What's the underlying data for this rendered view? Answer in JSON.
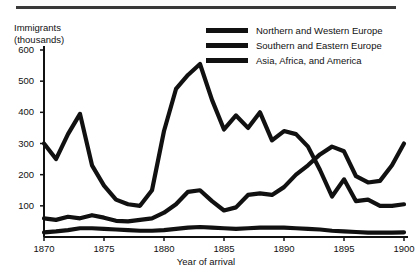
{
  "figure": {
    "top_rule": "decorative-rule",
    "y_axis_title": "Immigrants\n(thousands)",
    "x_axis_title": "Year of arrival"
  },
  "legend": {
    "position": "top-right",
    "entries": [
      {
        "label": "Northern and Western Europe",
        "color": "#111111",
        "thickness": 5
      },
      {
        "label": "Southern and Eastern Europe",
        "color": "#111111",
        "thickness": 5
      },
      {
        "label": "Asia, Africa, and America",
        "color": "#111111",
        "thickness": 5
      }
    ]
  },
  "chart_data": {
    "type": "line",
    "title": "",
    "xlabel": "Year of arrival",
    "ylabel": "Immigrants (thousands)",
    "xlim": [
      1870,
      1900
    ],
    "ylim": [
      0,
      600
    ],
    "xticks": [
      1870,
      1875,
      1880,
      1885,
      1890,
      1895,
      1900
    ],
    "yticks": [
      0,
      100,
      200,
      300,
      400,
      500,
      600
    ],
    "xticklabels": [
      "1870",
      "1875",
      "1880",
      "1885",
      "1890",
      "1895",
      "1900"
    ],
    "yticklabels": [
      "0",
      "100",
      "200",
      "300",
      "400",
      "500",
      "600"
    ],
    "grid": false,
    "legend_position": "top-right",
    "x": [
      1870,
      1871,
      1872,
      1873,
      1874,
      1875,
      1876,
      1877,
      1878,
      1879,
      1880,
      1881,
      1882,
      1883,
      1884,
      1885,
      1886,
      1887,
      1888,
      1889,
      1890,
      1891,
      1892,
      1893,
      1894,
      1895,
      1896,
      1897,
      1898,
      1899,
      1900
    ],
    "series": [
      {
        "name": "Northern and Western Europe",
        "color": "#111111",
        "values": [
          300,
          250,
          330,
          395,
          230,
          165,
          120,
          105,
          100,
          150,
          340,
          475,
          520,
          555,
          440,
          345,
          390,
          350,
          400,
          310,
          340,
          330,
          290,
          215,
          130,
          185,
          115,
          120,
          100,
          100,
          105
        ]
      },
      {
        "name": "Southern and Eastern Europe",
        "color": "#111111",
        "values": [
          60,
          55,
          65,
          60,
          70,
          62,
          52,
          50,
          55,
          60,
          78,
          105,
          145,
          150,
          115,
          85,
          95,
          135,
          140,
          135,
          160,
          200,
          230,
          265,
          290,
          275,
          195,
          175,
          180,
          230,
          300
        ]
      },
      {
        "name": "Asia, Africa, and America",
        "color": "#111111",
        "values": [
          15,
          18,
          22,
          28,
          28,
          26,
          24,
          22,
          20,
          20,
          22,
          26,
          30,
          32,
          30,
          28,
          26,
          28,
          30,
          30,
          30,
          28,
          26,
          24,
          20,
          18,
          16,
          14,
          14,
          14,
          15
        ]
      }
    ]
  }
}
